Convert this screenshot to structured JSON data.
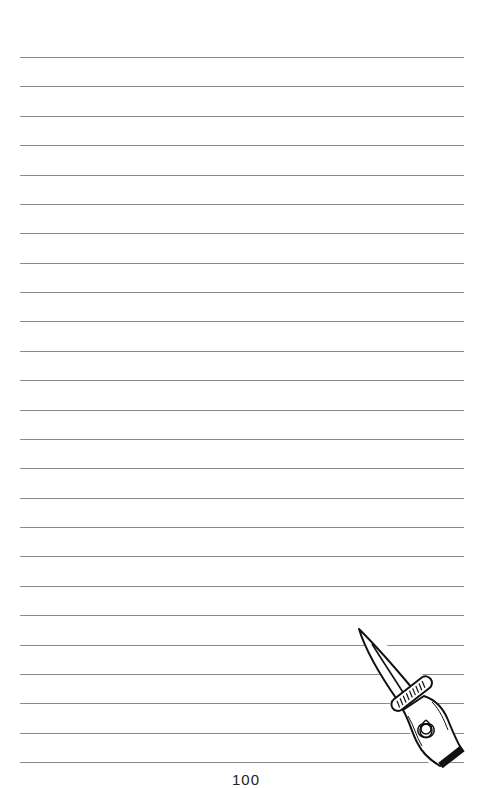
{
  "page": {
    "type": "lined notebook page",
    "background": "#ffffff",
    "line_color": "#8a8a8a",
    "line_count": 25,
    "line_start_y": 57,
    "line_spacing": 29.375,
    "line_left_x": 20,
    "line_right_x": 464
  },
  "illustration": {
    "icon": "dagger-icon",
    "description": "Athame dagger with triquetra on handle",
    "emblem": "triquetra-icon"
  },
  "footer": {
    "page_number": "100"
  }
}
